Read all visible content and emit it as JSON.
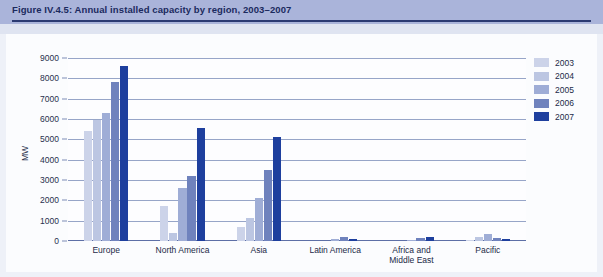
{
  "figure": {
    "title": "Figure IV.4.5: Annual installed capacity by region, 2003–2007"
  },
  "chart_data": {
    "type": "bar",
    "title": "Annual installed capacity by region, 2003–2007",
    "xlabel": "",
    "ylabel": "MW",
    "ylim": [
      0,
      9000
    ],
    "ytick_labels": [
      "0",
      "1000",
      "2000",
      "3000",
      "4000",
      "5000",
      "6000",
      "7000",
      "8000",
      "9000"
    ],
    "ytick_values": [
      0,
      1000,
      2000,
      3000,
      4000,
      5000,
      6000,
      7000,
      8000,
      9000
    ],
    "grid": true,
    "legend_position": "right",
    "categories": [
      "Europe",
      "North America",
      "Asia",
      "Latin America",
      "Africa and Middle East",
      "Pacific"
    ],
    "series": [
      {
        "name": "2003",
        "color": "#ccd3e9",
        "values": [
          5400,
          1700,
          700,
          0,
          0,
          60
        ]
      },
      {
        "name": "2004",
        "color": "#bcc6e2",
        "values": [
          5950,
          400,
          1150,
          0,
          0,
          200
        ]
      },
      {
        "name": "2005",
        "color": "#9fadd6",
        "values": [
          6300,
          2600,
          2100,
          120,
          60,
          350
        ]
      },
      {
        "name": "2006",
        "color": "#6f82bd",
        "values": [
          7800,
          3200,
          3500,
          200,
          130,
          150
        ]
      },
      {
        "name": "2007",
        "color": "#1e3f9e",
        "values": [
          8600,
          5550,
          5100,
          100,
          180,
          110
        ]
      }
    ]
  },
  "legend": {
    "items": [
      {
        "label": "2003"
      },
      {
        "label": "2004"
      },
      {
        "label": "2005"
      },
      {
        "label": "2006"
      },
      {
        "label": "2007"
      }
    ]
  }
}
